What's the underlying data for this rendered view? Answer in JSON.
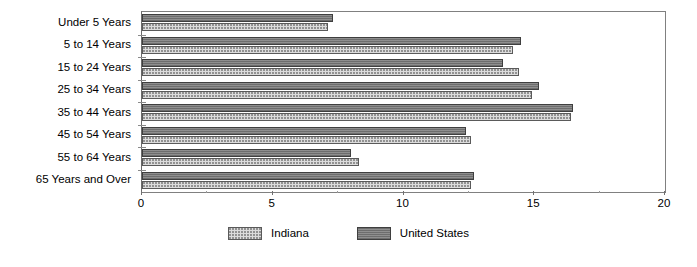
{
  "chart_data": {
    "type": "bar",
    "orientation": "horizontal",
    "title": "",
    "subtitle": "",
    "xlabel": "",
    "ylabel": "",
    "xlim": [
      0,
      20
    ],
    "xticks": [
      0,
      5,
      10,
      15,
      20
    ],
    "xtick_labels": [
      "0",
      "5",
      "10",
      "15",
      "20"
    ],
    "grid": false,
    "legend_position": "bottom",
    "categories": [
      "Under 5 Years",
      "5 to 14 Years",
      "15 to 24 Years",
      "25 to 34 Years",
      "35 to 44 Years",
      "45 to 54 Years",
      "55 to 64 Years",
      "65 Years and Over"
    ],
    "series": [
      {
        "name": "United States",
        "pattern": "dark-solid",
        "color": "#828282",
        "values": [
          7.3,
          14.5,
          13.8,
          15.2,
          16.5,
          12.4,
          8.0,
          12.7
        ]
      },
      {
        "name": "Indiana",
        "pattern": "light-dotted",
        "color": "#dcdcdc",
        "values": [
          7.1,
          14.2,
          14.4,
          14.9,
          16.4,
          12.6,
          8.3,
          12.6
        ]
      }
    ]
  },
  "legend": {
    "entries": [
      {
        "label": "Indiana",
        "key": "indiana"
      },
      {
        "label": "United States",
        "key": "us"
      }
    ]
  }
}
